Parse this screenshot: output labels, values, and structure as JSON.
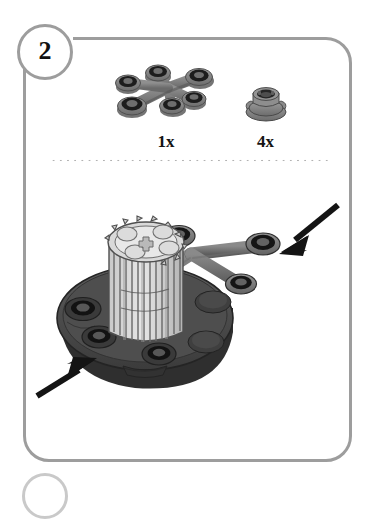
{
  "page": {
    "background_color": "#ffffff",
    "width": 373,
    "height": 487,
    "document_type": "lego-style building instruction step"
  },
  "step": {
    "number": "2",
    "circle_border_color": "#9d9d9d",
    "number_color": "#111111"
  },
  "frame": {
    "border_color": "#9d9d9d",
    "corner_radius_px": 26
  },
  "divider": {
    "style": "dotted",
    "color": "#b2b2b2"
  },
  "parts_bin": {
    "label": "Parts needed for this step",
    "parts": [
      {
        "id": "branched-connector-plate",
        "name": "Branched 6-ring connector plate",
        "quantity_label": "1x",
        "quantity": 1,
        "body_color": "#7d7d7d",
        "ring_color": "#1c1c1c",
        "ring_count": 6
      },
      {
        "id": "round-tabbed-stud",
        "name": "Small round tabbed bushing",
        "quantity_label": "4x",
        "quantity": 4,
        "body_color": "#8a8a8a",
        "ring_color": "#2a2a2a"
      }
    ]
  },
  "assembly": {
    "description": "Turntable base with ribbed gear cylinder; branched connector plate attaches to the right side",
    "components": [
      {
        "id": "turntable-base",
        "name": "Round turntable base plate",
        "color": "#4a4a4a"
      },
      {
        "id": "ribbed-gear-cylinder",
        "name": "Ribbed gear cylinder",
        "color": "#d4d4d4"
      },
      {
        "id": "attached-branched-plate",
        "name": "Branched connector plate (being attached)",
        "color": "#767676"
      }
    ],
    "arrows": [
      {
        "id": "arrow-top-right",
        "direction": "down-left",
        "points_to": "branched connector plate attach point",
        "color": "#141414"
      },
      {
        "id": "arrow-bottom-left",
        "direction": "up-right",
        "points_to": "turntable base attach point",
        "color": "#141414"
      }
    ]
  },
  "next_step_peek": {
    "visible": true,
    "color": "#c9c9c9"
  }
}
